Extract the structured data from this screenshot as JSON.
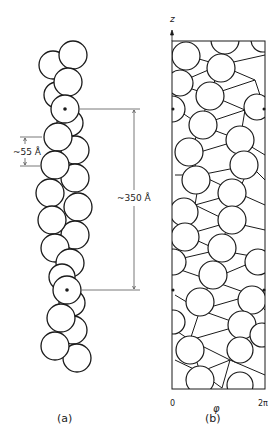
{
  "panel_a": {
    "caption": "(a)",
    "subunit_spacing_label": "~55 Å",
    "repeat_length_label": "~350 Å",
    "description": "Helical chain of globular subunits (two strands); dotted subunits mark the repeat"
  },
  "panel_b": {
    "caption": "(b)",
    "axis_z_label": "z",
    "axis_phi_label": "φ",
    "phi_min_label": "0",
    "phi_max_label": "2π",
    "description": "Cylindrical projection (helical net) of subunit lattice"
  },
  "colors": {
    "stroke": "#1a1a1a",
    "background": "#ffffff",
    "dimension_line": "#555555"
  }
}
